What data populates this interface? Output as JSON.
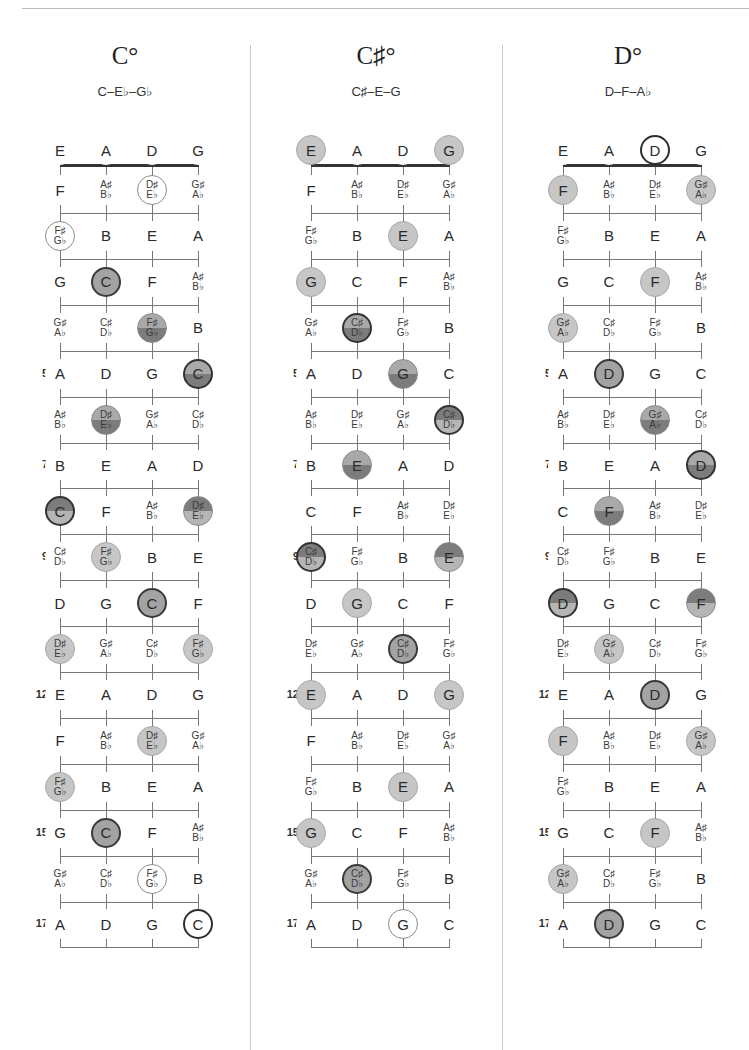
{
  "strings": [
    "E",
    "A",
    "D",
    "G"
  ],
  "fretboard_notes": [
    [
      "E",
      "A",
      "D",
      "G"
    ],
    [
      "F",
      "A♯|B♭",
      "D♯|E♭",
      "G♯|A♭"
    ],
    [
      "F♯|G♭",
      "B",
      "E",
      "A"
    ],
    [
      "G",
      "C",
      "F",
      "A♯|B♭"
    ],
    [
      "G♯|A♭",
      "C♯|D♭",
      "F♯|G♭",
      "B"
    ],
    [
      "A",
      "D",
      "G",
      "C"
    ],
    [
      "A♯|B♭",
      "D♯|E♭",
      "G♯|A♭",
      "C♯|D♭"
    ],
    [
      "B",
      "E",
      "A",
      "D"
    ],
    [
      "C",
      "F",
      "A♯|B♭",
      "D♯|E♭"
    ],
    [
      "C♯|D♭",
      "F♯|G♭",
      "B",
      "E"
    ],
    [
      "D",
      "G",
      "C",
      "F"
    ],
    [
      "D♯|E♭",
      "G♯|A♭",
      "C♯|D♭",
      "F♯|G♭"
    ],
    [
      "E",
      "A",
      "D",
      "G"
    ],
    [
      "F",
      "A♯|B♭",
      "D♯|E♭",
      "G♯|A♭"
    ],
    [
      "F♯|G♭",
      "B",
      "E",
      "A"
    ],
    [
      "G",
      "C",
      "F",
      "A♯|B♭"
    ],
    [
      "G♯|A♭",
      "C♯|D♭",
      "F♯|G♭",
      "B"
    ],
    [
      "A",
      "D",
      "G",
      "C"
    ]
  ],
  "fret_markers": [
    5,
    7,
    9,
    12,
    15,
    17
  ],
  "charts": [
    {
      "name": "C°",
      "notes": "C–E♭–G♭",
      "highlights": {
        "1-2": "tone-out",
        "2-0": "tone-out",
        "3-1": "root",
        "4-2": "split-ld",
        "5-3": "split-ld+outline",
        "6-1": "split-ld",
        "8-0": "split-dl+outline",
        "8-3": "split-dl",
        "9-1": "tone",
        "10-2": "root",
        "11-0": "tone",
        "11-3": "tone",
        "13-2": "tone",
        "14-0": "tone",
        "15-1": "root",
        "16-2": "tone-out",
        "17-3": "root-out"
      }
    },
    {
      "name": "C♯°",
      "notes": "C♯–E–G",
      "highlights": {
        "0-0": "tone",
        "0-3": "tone",
        "2-2": "tone",
        "3-0": "tone",
        "4-1": "split-ld+outline",
        "5-2": "split-ld",
        "6-3": "split-dl+outline",
        "7-1": "split-ld",
        "9-0": "split-dl+outline",
        "9-3": "split-dl",
        "10-1": "tone",
        "11-2": "root",
        "12-0": "tone",
        "12-3": "tone",
        "14-2": "tone",
        "15-0": "tone",
        "16-1": "root",
        "17-2": "tone-out"
      }
    },
    {
      "name": "D°",
      "notes": "D–F–A♭",
      "highlights": {
        "0-2": "root-out",
        "1-0": "tone",
        "1-3": "tone",
        "3-2": "tone",
        "4-0": "tone",
        "5-1": "root",
        "6-2": "split-ld",
        "7-3": "split-ld+outline",
        "8-1": "split-ld",
        "10-0": "split-dl+outline",
        "10-3": "split-dl",
        "11-1": "tone",
        "12-2": "root",
        "13-0": "tone",
        "13-3": "tone",
        "15-2": "tone",
        "16-0": "tone",
        "17-1": "root"
      }
    }
  ],
  "layout": {
    "panel_left": [
      0,
      251,
      503
    ],
    "string_x": [
      60,
      106,
      152,
      198
    ],
    "open_row_y": 150,
    "first_row_y": 190,
    "row_spacing": 45.9
  }
}
